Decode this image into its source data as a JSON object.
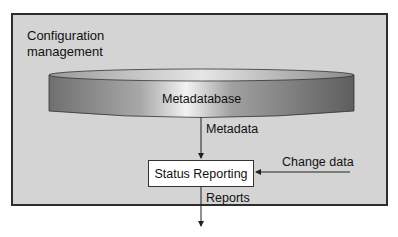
{
  "diagram": {
    "container_label_lines": [
      "Configuration",
      "management"
    ],
    "database_label": "Metadatabase",
    "process_label": "Status Reporting",
    "flows": [
      {
        "from": "Metadatabase",
        "to": "Status Reporting",
        "label": "Metadata"
      },
      {
        "from": "external",
        "to": "Status Reporting",
        "label": "Change data"
      },
      {
        "from": "Status Reporting",
        "to": "external",
        "label": "Reports"
      }
    ]
  }
}
